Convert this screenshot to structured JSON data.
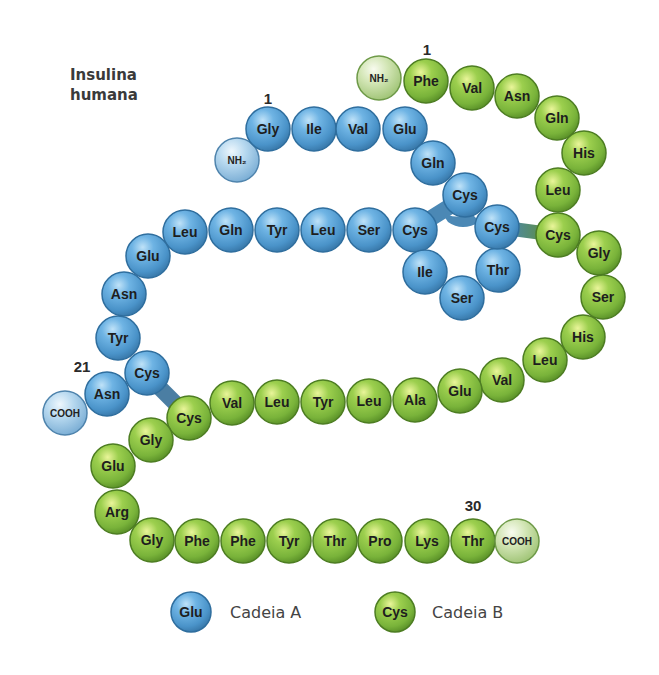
{
  "title": {
    "line1": "Insulina",
    "line2": "humana"
  },
  "colors": {
    "chain_a": "#5aa6dc",
    "chain_a_terminal": "#a9d0ec",
    "chain_b": "#8cc63f",
    "chain_b_terminal": "#d6e9bd",
    "bridge_a": "#4b88b5",
    "bridge_ab": "#5f8f3a"
  },
  "labels": {
    "chain_a_start": "1",
    "chain_a_end": "21",
    "chain_b_start": "1",
    "chain_b_end": "30"
  },
  "chain_a": {
    "name": "Cadeia A",
    "n_terminal": {
      "label": "NH₂",
      "x": 237,
      "y": 160
    },
    "c_terminal": {
      "label": "COOH",
      "x": 65,
      "y": 413
    },
    "residues": [
      {
        "pos": 1,
        "label": "Gly",
        "x": 268,
        "y": 129
      },
      {
        "pos": 2,
        "label": "Ile",
        "x": 314,
        "y": 129
      },
      {
        "pos": 3,
        "label": "Val",
        "x": 358,
        "y": 129
      },
      {
        "pos": 4,
        "label": "Glu",
        "x": 405,
        "y": 129
      },
      {
        "pos": 5,
        "label": "Gln",
        "x": 433,
        "y": 163
      },
      {
        "pos": 6,
        "label": "Cys",
        "x": 465,
        "y": 195
      },
      {
        "pos": 7,
        "label": "Cys",
        "x": 415,
        "y": 230
      },
      {
        "pos": 8,
        "label": "Thr",
        "x": 498,
        "y": 270
      },
      {
        "pos": 9,
        "label": "Ser",
        "x": 462,
        "y": 298
      },
      {
        "pos": 10,
        "label": "Ile",
        "x": 425,
        "y": 272
      },
      {
        "pos": 11,
        "label": "Cys",
        "x": 497,
        "y": 227
      },
      {
        "pos": 12,
        "label": "Ser",
        "x": 369,
        "y": 230
      },
      {
        "pos": 13,
        "label": "Leu",
        "x": 323,
        "y": 230
      },
      {
        "pos": 14,
        "label": "Tyr",
        "x": 277,
        "y": 230
      },
      {
        "pos": 15,
        "label": "Gln",
        "x": 231,
        "y": 230
      },
      {
        "pos": 16,
        "label": "Leu",
        "x": 185,
        "y": 232
      },
      {
        "pos": 17,
        "label": "Glu",
        "x": 148,
        "y": 256
      },
      {
        "pos": 18,
        "label": "Asn",
        "x": 124,
        "y": 294
      },
      {
        "pos": 19,
        "label": "Tyr",
        "x": 118,
        "y": 338
      },
      {
        "pos": 20,
        "label": "Cys",
        "x": 147,
        "y": 373
      },
      {
        "pos": 21,
        "label": "Asn",
        "x": 107,
        "y": 394
      }
    ]
  },
  "chain_b": {
    "name": "Cadeia B",
    "n_terminal": {
      "label": "NH₂",
      "x": 379,
      "y": 78
    },
    "c_terminal": {
      "label": "COOH",
      "x": 517,
      "y": 541
    },
    "residues": [
      {
        "pos": 1,
        "label": "Phe",
        "x": 426,
        "y": 81
      },
      {
        "pos": 2,
        "label": "Val",
        "x": 472,
        "y": 88
      },
      {
        "pos": 3,
        "label": "Asn",
        "x": 517,
        "y": 96
      },
      {
        "pos": 4,
        "label": "Gln",
        "x": 557,
        "y": 118
      },
      {
        "pos": 5,
        "label": "His",
        "x": 584,
        "y": 153
      },
      {
        "pos": 6,
        "label": "Leu",
        "x": 558,
        "y": 190
      },
      {
        "pos": 7,
        "label": "Cys",
        "x": 558,
        "y": 235
      },
      {
        "pos": 8,
        "label": "Gly",
        "x": 599,
        "y": 253
      },
      {
        "pos": 9,
        "label": "Ser",
        "x": 603,
        "y": 297
      },
      {
        "pos": 10,
        "label": "His",
        "x": 583,
        "y": 337
      },
      {
        "pos": 11,
        "label": "Leu",
        "x": 545,
        "y": 360
      },
      {
        "pos": 12,
        "label": "Val",
        "x": 502,
        "y": 380
      },
      {
        "pos": 13,
        "label": "Glu",
        "x": 460,
        "y": 391
      },
      {
        "pos": 14,
        "label": "Ala",
        "x": 415,
        "y": 400
      },
      {
        "pos": 15,
        "label": "Leu",
        "x": 369,
        "y": 401
      },
      {
        "pos": 16,
        "label": "Tyr",
        "x": 323,
        "y": 402
      },
      {
        "pos": 17,
        "label": "Leu",
        "x": 277,
        "y": 402
      },
      {
        "pos": 18,
        "label": "Val",
        "x": 232,
        "y": 403
      },
      {
        "pos": 19,
        "label": "Cys",
        "x": 189,
        "y": 418
      },
      {
        "pos": 20,
        "label": "Gly",
        "x": 151,
        "y": 440
      },
      {
        "pos": 21,
        "label": "Glu",
        "x": 113,
        "y": 466
      },
      {
        "pos": 22,
        "label": "Arg",
        "x": 117,
        "y": 512
      },
      {
        "pos": 23,
        "label": "Gly",
        "x": 152,
        "y": 540
      },
      {
        "pos": 24,
        "label": "Phe",
        "x": 197,
        "y": 541
      },
      {
        "pos": 25,
        "label": "Phe",
        "x": 243,
        "y": 541
      },
      {
        "pos": 26,
        "label": "Tyr",
        "x": 289,
        "y": 541
      },
      {
        "pos": 27,
        "label": "Thr",
        "x": 335,
        "y": 541
      },
      {
        "pos": 28,
        "label": "Pro",
        "x": 380,
        "y": 541
      },
      {
        "pos": 29,
        "label": "Lys",
        "x": 427,
        "y": 541
      },
      {
        "pos": 30,
        "label": "Thr",
        "x": 473,
        "y": 541
      }
    ]
  },
  "disulfide_bridges": [
    {
      "from": "A6",
      "to": "A11",
      "type": "intra"
    },
    {
      "from": "A7",
      "to": "B7",
      "type": "inter"
    },
    {
      "from": "A20",
      "to": "B19",
      "type": "inter"
    }
  ],
  "legend": {
    "items": [
      {
        "sample": "Glu",
        "label": "Cadeia A",
        "chain": "a"
      },
      {
        "sample": "Cys",
        "label": "Cadeia B",
        "chain": "b"
      }
    ]
  }
}
